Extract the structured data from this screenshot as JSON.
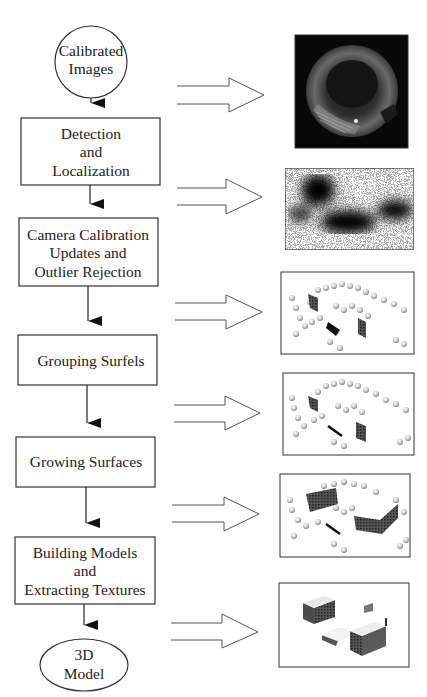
{
  "diagram": {
    "type": "pipeline-flowchart",
    "nodes": [
      {
        "id": "start",
        "shape": "circle",
        "lines": [
          "Calibrated",
          "Images"
        ]
      },
      {
        "id": "step1",
        "shape": "rect",
        "lines": [
          "Detection",
          "and",
          "Localization"
        ]
      },
      {
        "id": "step2",
        "shape": "rect",
        "lines": [
          "Camera Calibration",
          "Updates and",
          "Outlier Rejection"
        ]
      },
      {
        "id": "step3",
        "shape": "rect",
        "lines": [
          "Grouping Surfels"
        ]
      },
      {
        "id": "step4",
        "shape": "rect",
        "lines": [
          "Growing Surfaces"
        ]
      },
      {
        "id": "step5",
        "shape": "rect",
        "lines": [
          "Building Models",
          "and",
          "Extracting Textures"
        ]
      },
      {
        "id": "end",
        "shape": "ellipse",
        "lines": [
          "3D",
          "Model"
        ]
      }
    ],
    "edges": [
      {
        "from": "start",
        "to": "step1"
      },
      {
        "from": "step1",
        "to": "step2"
      },
      {
        "from": "step2",
        "to": "step3"
      },
      {
        "from": "step3",
        "to": "step4"
      },
      {
        "from": "step4",
        "to": "step5"
      },
      {
        "from": "step5",
        "to": "end"
      }
    ],
    "result_images": [
      {
        "id": "img1",
        "description": "fisheye-spherical-image",
        "style": "dark"
      },
      {
        "id": "img2",
        "description": "detection-density-map",
        "style": "noise"
      },
      {
        "id": "img3",
        "description": "surfels-after-outlier-rejection",
        "style": "surfels"
      },
      {
        "id": "img4",
        "description": "grouped-surfels",
        "style": "surfels"
      },
      {
        "id": "img5",
        "description": "grown-surfaces",
        "style": "surfels"
      },
      {
        "id": "img6",
        "description": "textured-3d-building-model",
        "style": "model"
      }
    ],
    "colors": {
      "line": "#222222",
      "box_border": "#333333",
      "hollow_arrow": "#555555",
      "image_dark": "#0a0a0a",
      "background": "#ffffff"
    }
  }
}
